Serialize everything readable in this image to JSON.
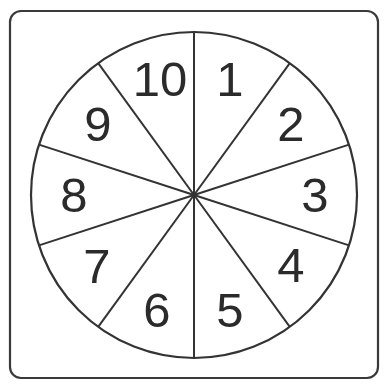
{
  "diagram": {
    "type": "spinner-wheel",
    "frame": {
      "x": 10,
      "y": 11,
      "width": 368,
      "height": 367,
      "corner_radius": 11,
      "stroke": "#3a3a3a"
    },
    "wheel": {
      "cx": 194,
      "cy": 195,
      "r": 163,
      "stroke": "#333333"
    },
    "segment_count": 10,
    "divider_start_angle_deg": 0,
    "segments": [
      {
        "label": "1",
        "x": 230,
        "y": 79
      },
      {
        "label": "2",
        "x": 291,
        "y": 124
      },
      {
        "label": "3",
        "x": 315,
        "y": 195
      },
      {
        "label": "4",
        "x": 291,
        "y": 265
      },
      {
        "label": "5",
        "x": 230,
        "y": 310
      },
      {
        "label": "6",
        "x": 157,
        "y": 310
      },
      {
        "label": "7",
        "x": 97,
        "y": 266
      },
      {
        "label": "8",
        "x": 74,
        "y": 195
      },
      {
        "label": "9",
        "x": 98,
        "y": 124
      },
      {
        "label": "10",
        "x": 160,
        "y": 79
      }
    ],
    "text_color": "#2b2b2b"
  }
}
